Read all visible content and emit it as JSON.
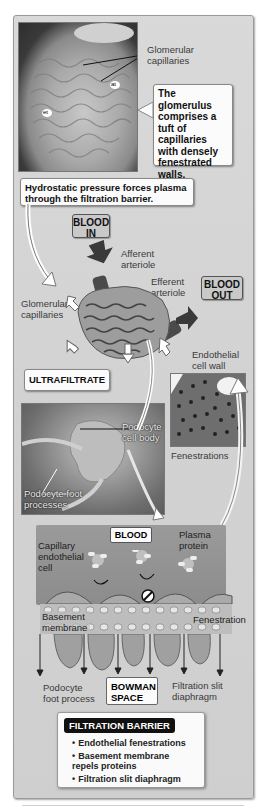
{
  "figure": {
    "top_photo": {
      "labels": {
        "glomerular_capillaries": "Glomerular\ncapillaries",
        "at": "at",
        "et": "et"
      },
      "callout": "The glomerulus comprises a tuft of capillaries with densely fenestrated walls."
    },
    "pressure_callout": "Hydrostatic pressure forces plasma through the filtration barrier.",
    "glomerulus": {
      "blood_in": "BLOOD IN",
      "blood_out": "BLOOD OUT",
      "afferent": "Afferent arteriole",
      "efferent": "Efferent arteriole",
      "capillaries": "Glomerular capillaries",
      "ultrafiltrate": "ULTRAFILTRATE"
    },
    "endothelial_photo": {
      "title": "Endothelial cell wall",
      "fenestrations": "Fenestrations"
    },
    "podocyte_photo": {
      "cell_body": "Podocyte cell body",
      "foot_processes": "Podocyte foot processes"
    },
    "barrier_diagram": {
      "blood": "BLOOD",
      "capillary_cell": "Capillary endothelial cell",
      "plasma_protein": "Plasma protein",
      "basement_membrane": "Basement membrane",
      "fenestration": "Fenestration",
      "podocyte_foot": "Podocyte foot process",
      "bowman_space": "BOWMAN SPACE",
      "slit_diaphragm": "Filtration slit diaphragm"
    },
    "filtration_barrier": {
      "title": "FILTRATION BARRIER",
      "items": [
        "Endothelial fenestrations",
        "Basement membrane repels proteins",
        "Filtration slit diaphragm"
      ]
    }
  },
  "colors": {
    "panel": "#d4d4d4",
    "blood_region": "#8f8f8f",
    "callout_bg": "#fbfbfb",
    "title_bg": "#111111"
  }
}
